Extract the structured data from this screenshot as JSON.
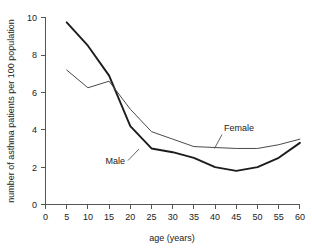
{
  "chart_data": {
    "type": "line",
    "title": "",
    "subtitle": "",
    "xlabel": "age (years)",
    "ylabel": "number of asthma patients per 100 population",
    "x": [
      5,
      10,
      15,
      20,
      25,
      30,
      35,
      40,
      45,
      50,
      55,
      60
    ],
    "xlim": [
      0,
      60
    ],
    "ylim": [
      0,
      10
    ],
    "xticks": [
      0,
      5,
      10,
      15,
      20,
      25,
      30,
      35,
      40,
      45,
      50,
      55,
      60
    ],
    "yticks": [
      0,
      2,
      4,
      6,
      8,
      10
    ],
    "xtick_labels": [
      "0",
      "5",
      "10",
      "15",
      "20",
      "25",
      "30",
      "35",
      "40",
      "45",
      "50",
      "55",
      "60"
    ],
    "ytick_labels": [
      "0",
      "2",
      "4",
      "6",
      "8",
      "10"
    ],
    "grid": false,
    "legend_position": "inline-annotation",
    "series": [
      {
        "name": "Male",
        "label": "Male",
        "color": "#1c1c1c",
        "values": [
          9.75,
          8.5,
          6.9,
          4.2,
          3.0,
          2.8,
          2.5,
          2.0,
          1.8,
          2.0,
          2.5,
          3.3
        ]
      },
      {
        "name": "Female",
        "label": "Female",
        "color": "#4a4a4a",
        "values": [
          7.2,
          6.25,
          6.6,
          5.1,
          3.9,
          3.5,
          3.1,
          3.05,
          3.0,
          3.0,
          3.2,
          3.5
        ]
      }
    ],
    "annotations": [
      {
        "text": "Male",
        "x": 19.5,
        "y": 2.35
      },
      {
        "text": "Female",
        "x": 41.5,
        "y": 4.35
      }
    ]
  }
}
